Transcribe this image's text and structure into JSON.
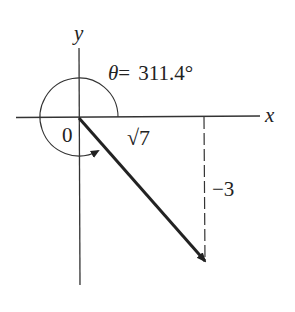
{
  "diagram": {
    "type": "vector-angle-diagram",
    "axes": {
      "x_label": "x",
      "y_label": "y",
      "origin_label": "0"
    },
    "angle": {
      "symbol": "θ",
      "equals": "=",
      "value": "311.4°",
      "full_label": "θ= 311.4°"
    },
    "vector": {
      "x_component_label": "√7",
      "y_component_label": "−3"
    },
    "colors": {
      "ink": "#222222",
      "background": "#ffffff"
    }
  }
}
